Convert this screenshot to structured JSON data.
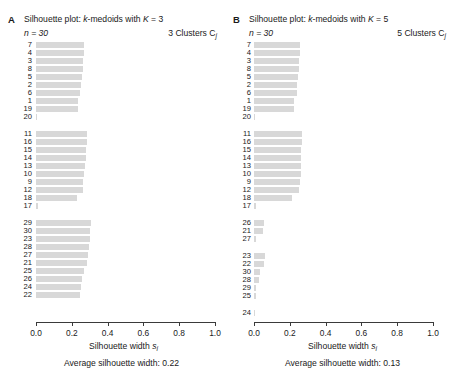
{
  "figure": {
    "width": 454,
    "height": 382,
    "bar_color": "#d8d8d8",
    "axis_color": "#3a3a3a"
  },
  "panels": [
    {
      "letter": "A",
      "title": "Silhouette plot: k-medoids with K = 3",
      "title_prefix": "Silhouette plot: ",
      "title_k_italic": "k",
      "title_mid": "-medoids with ",
      "title_K_italic": "K",
      "title_suffix": " = 3",
      "n_label": "n = 30",
      "clusters_label": "3 Clusters C",
      "clusters_sub": "j",
      "xlabel_main": "Silhouette width ",
      "xlabel_sym": "s",
      "xlabel_sub": "i",
      "avg_label": "Average silhouette width:  0.22",
      "avg_value": 0.22
    },
    {
      "letter": "B",
      "title": "Silhouette plot: k-medoids with K = 5",
      "title_prefix": "Silhouette plot: ",
      "title_k_italic": "k",
      "title_mid": "-medoids with ",
      "title_K_italic": "K",
      "title_suffix": " = 5",
      "n_label": "n = 30",
      "clusters_label": "5 Clusters C",
      "clusters_sub": "j",
      "xlabel_main": "Silhouette width ",
      "xlabel_sym": "s",
      "xlabel_sub": "i",
      "avg_label": "Average silhouette width:  0.13",
      "avg_value": 0.13
    }
  ],
  "chart_data": [
    {
      "type": "bar",
      "orientation": "horizontal",
      "title": "Silhouette plot: k-medoids with K = 3",
      "subtitle": "n = 30",
      "xlabel": "Silhouette width s_i",
      "ylabel": "",
      "xlim": [
        0.0,
        1.0
      ],
      "xticks": [
        0.0,
        0.2,
        0.4,
        0.6,
        0.8,
        1.0
      ],
      "xticklabels": [
        "0.0",
        "0.2",
        "0.4",
        "0.6",
        "0.8",
        "1.0"
      ],
      "grid": false,
      "legend": null,
      "average_silhouette_width": 0.22,
      "n": 30,
      "k": 3,
      "clusters": [
        {
          "name": "C1",
          "observations": [
            "7",
            "4",
            "3",
            "8",
            "5",
            "2",
            "6",
            "1",
            "19",
            "20"
          ],
          "values": [
            0.27,
            0.27,
            0.265,
            0.26,
            0.255,
            0.25,
            0.245,
            0.235,
            0.235,
            0.005
          ]
        },
        {
          "name": "C2",
          "observations": [
            "11",
            "16",
            "15",
            "14",
            "13",
            "10",
            "9",
            "12",
            "18",
            "17"
          ],
          "values": [
            0.285,
            0.285,
            0.28,
            0.28,
            0.275,
            0.27,
            0.265,
            0.26,
            0.23,
            0.01
          ]
        },
        {
          "name": "C3",
          "observations": [
            "29",
            "30",
            "23",
            "28",
            "27",
            "21",
            "25",
            "26",
            "24",
            "22"
          ],
          "values": [
            0.305,
            0.3,
            0.3,
            0.295,
            0.29,
            0.285,
            0.27,
            0.255,
            0.25,
            0.245
          ]
        }
      ]
    },
    {
      "type": "bar",
      "orientation": "horizontal",
      "title": "Silhouette plot: k-medoids with K = 5",
      "subtitle": "n = 30",
      "xlabel": "Silhouette width s_i",
      "ylabel": "",
      "xlim": [
        0.0,
        1.0
      ],
      "xticks": [
        0.0,
        0.2,
        0.4,
        0.6,
        0.8,
        1.0
      ],
      "xticklabels": [
        "0.0",
        "0.2",
        "0.4",
        "0.6",
        "0.8",
        "1.0"
      ],
      "grid": false,
      "legend": null,
      "average_silhouette_width": 0.13,
      "n": 30,
      "k": 5,
      "clusters": [
        {
          "name": "C1",
          "observations": [
            "7",
            "4",
            "3",
            "8",
            "5",
            "2",
            "6",
            "1",
            "19",
            "20"
          ],
          "values": [
            0.255,
            0.255,
            0.25,
            0.25,
            0.245,
            0.24,
            0.24,
            0.225,
            0.225,
            0.005
          ]
        },
        {
          "name": "C2",
          "observations": [
            "11",
            "16",
            "15",
            "14",
            "13",
            "10",
            "9",
            "12",
            "18",
            "17"
          ],
          "values": [
            0.27,
            0.27,
            0.265,
            0.265,
            0.26,
            0.26,
            0.255,
            0.25,
            0.215,
            0.01
          ]
        },
        {
          "name": "C3",
          "observations": [
            "26",
            "21",
            "27"
          ],
          "values": [
            0.055,
            0.05,
            0.012
          ]
        },
        {
          "name": "C4",
          "observations": [
            "23",
            "22",
            "30",
            "28",
            "29",
            "25"
          ],
          "values": [
            0.06,
            0.055,
            0.032,
            0.03,
            0.012,
            0.01
          ]
        },
        {
          "name": "C5",
          "observations": [
            "24"
          ],
          "values": [
            0.0
          ]
        }
      ]
    }
  ]
}
